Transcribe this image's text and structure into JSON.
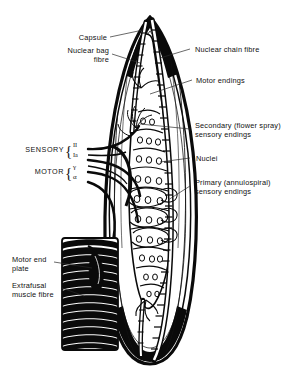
{
  "figure": {
    "background_color": "#ffffff",
    "ink_color": "#0a0a0a",
    "width": 288,
    "height": 374
  },
  "labels": {
    "capsule": "Capsule",
    "nuclear_bag_fibre_line1": "Nuclear bag",
    "nuclear_bag_fibre_line2": "fibre",
    "nuclear_chain_fibre": "Nuclear chain fibre",
    "motor_endings": "Motor endings",
    "secondary_endings_line1": "Secondary (flower spray)",
    "secondary_endings_line2": "sensory endings",
    "nuclei": "Nuclei",
    "primary_endings_line1": "Primary (annulospiral)",
    "primary_endings_line2": "sensory endings",
    "motor_end_plate_line1": "Motor end",
    "motor_end_plate_line2": "plate",
    "extrafusal_fibre_line1": "Extrafusal",
    "extrafusal_fibre_line2": "muscle fibre"
  },
  "nerve_groups": {
    "sensory": {
      "label": "SENSORY",
      "fibres": [
        {
          "name": "group-II",
          "symbol": "II"
        },
        {
          "name": "group-Ia",
          "symbol": "Ia"
        }
      ]
    },
    "motor": {
      "label": "MOTOR",
      "fibres": [
        {
          "name": "gamma-motor",
          "symbol": "γ"
        },
        {
          "name": "alpha-motor",
          "symbol": "α"
        }
      ]
    }
  },
  "anatomy": {
    "spindle": {
      "name": "muscle-spindle",
      "capsule_top_y": 18,
      "capsule_bottom_y": 362,
      "equator_y": 195
    },
    "intrafusal_fibres": [
      {
        "name": "nuclear-bag-fibre",
        "nuclei_rows": 10,
        "nuclei_per_row_max": 4
      },
      {
        "name": "nuclear-chain-fibre",
        "nuclei_rows": 11,
        "nuclei_per_row_max": 1
      }
    ],
    "extrafusal_fibre": {
      "name": "extrafusal-muscle-fibre",
      "striation_bands": 14,
      "x": 62,
      "y": 238,
      "width": 56,
      "height": 112
    },
    "nerve_fibre_count": 4
  }
}
